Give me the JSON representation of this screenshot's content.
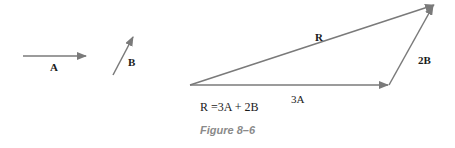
{
  "figure": {
    "caption": "Figure 8–6",
    "equation": "R =3A + 2B",
    "arrow_color": "#7a7a7a",
    "vectors": {
      "A": {
        "label": "A"
      },
      "B": {
        "label": "B"
      },
      "threeA": {
        "label": "3A"
      },
      "twoB": {
        "label": "2B"
      },
      "R": {
        "label": "R"
      }
    }
  }
}
